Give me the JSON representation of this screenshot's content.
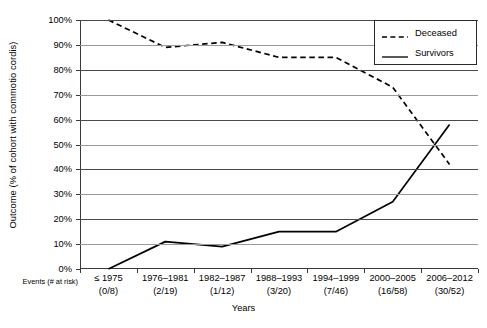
{
  "chart_data": {
    "type": "line",
    "title": "",
    "xlabel": "Years",
    "ylabel": "Outcome (% of cohort with commotio cordis)",
    "ylim": [
      0,
      100
    ],
    "ytick_labels": [
      "0%",
      "10%",
      "20%",
      "30%",
      "40%",
      "50%",
      "60%",
      "70%",
      "80%",
      "90%",
      "100%"
    ],
    "ytick_values": [
      0,
      10,
      20,
      30,
      40,
      50,
      60,
      70,
      80,
      90,
      100
    ],
    "grid": true,
    "legend_position": "top-right",
    "categories": [
      "≤ 1975",
      "1976–1981",
      "1982–1987",
      "1988–1993",
      "1994–1999",
      "2000–2005",
      "2006–2012"
    ],
    "at_risk": [
      "(0/8)",
      "(2/19)",
      "(1/12)",
      "(3/20)",
      "(7/46)",
      "(16/58)",
      "(30/52)"
    ],
    "at_risk_label": "Events (# at risk)",
    "series": [
      {
        "name": "Deceased",
        "style": "dashed",
        "color": "#000000",
        "values": [
          100,
          89,
          91,
          85,
          85,
          73,
          42
        ]
      },
      {
        "name": "Survivors",
        "style": "solid",
        "color": "#000000",
        "values": [
          0,
          11,
          9,
          15,
          15,
          27,
          58
        ]
      }
    ]
  },
  "legend": {
    "items": [
      {
        "label": "Deceased",
        "style": "dashed"
      },
      {
        "label": "Survivors",
        "style": "solid"
      }
    ]
  }
}
